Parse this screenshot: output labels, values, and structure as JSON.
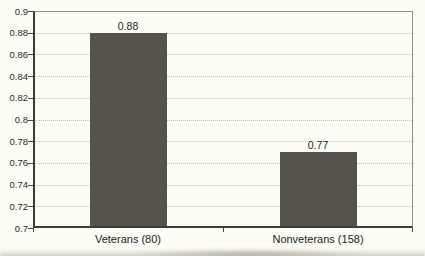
{
  "chart_data": {
    "type": "bar",
    "title": "",
    "xlabel": "",
    "ylabel": "",
    "categories": [
      "Veterans (80)",
      "Nonveterans (158)"
    ],
    "values": [
      0.88,
      0.77
    ],
    "value_labels": [
      "0.88",
      "0.77"
    ],
    "ylim": [
      0.7,
      0.9
    ],
    "ytick_step": 0.02,
    "ytick_labels_top_to_bottom": [
      "0.9",
      "0.88",
      "0.86",
      "0.84",
      "0.82",
      "0.8",
      "0.78",
      "0.76",
      "0.74",
      "0.72",
      "0.7"
    ],
    "grid": "horizontal-dotted",
    "legend": "none",
    "colors": {
      "bar": "#56524d",
      "axis": "#4a4843",
      "plot_border": "#90908a",
      "gridline": "#c6c6ba",
      "text": "#21211d",
      "background": "#fcfcf6"
    }
  }
}
